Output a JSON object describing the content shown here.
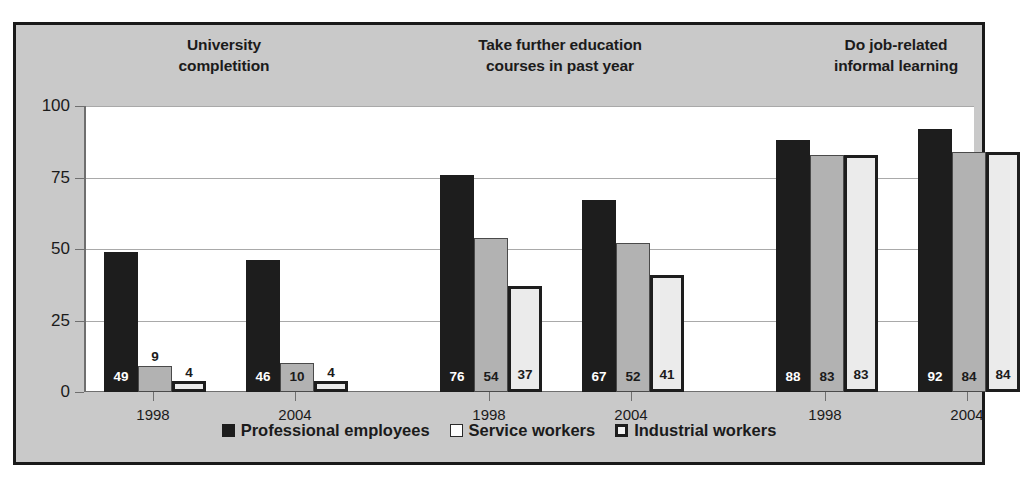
{
  "chart_data": {
    "type": "bar",
    "title": "",
    "xlabel": "",
    "ylabel": "",
    "ylim": [
      0,
      100
    ],
    "yticks": [
      "0",
      "25",
      "50",
      "75",
      "100"
    ],
    "grid": true,
    "legend_position": "bottom",
    "groups": [
      {
        "title_line1": "University",
        "title_line2": "completition",
        "clusters": [
          {
            "year": "1998",
            "values": [
              49,
              9,
              4
            ]
          },
          {
            "year": "2004",
            "values": [
              46,
              10,
              4
            ]
          }
        ]
      },
      {
        "title_line1": "Take further education",
        "title_line2": "courses in past year",
        "clusters": [
          {
            "year": "1998",
            "values": [
              76,
              54,
              37
            ]
          },
          {
            "year": "2004",
            "values": [
              67,
              52,
              41
            ]
          }
        ]
      },
      {
        "title_line1": "Do job-related",
        "title_line2": "informal learning",
        "clusters": [
          {
            "year": "1998",
            "values": [
              88,
              83,
              83
            ]
          },
          {
            "year": "2004",
            "values": [
              92,
              84,
              84
            ]
          }
        ]
      }
    ],
    "series": [
      {
        "name": "Professional employees",
        "color": "#1d1d1d",
        "values": [
          49,
          46,
          76,
          67,
          88,
          92
        ]
      },
      {
        "name": "Service workers",
        "color": "#b2b2b2",
        "values": [
          9,
          10,
          54,
          52,
          83,
          84
        ]
      },
      {
        "name": "Industrial workers",
        "color": "#ebebeb",
        "values": [
          4,
          4,
          37,
          41,
          83,
          84
        ]
      }
    ],
    "categories": [
      "1998",
      "2004",
      "1998",
      "2004",
      "1998",
      "2004"
    ]
  },
  "legend": {
    "items": [
      {
        "label": "Professional employees",
        "swatch": "filled-black-square-icon"
      },
      {
        "label": "Service workers",
        "swatch": "outlined-white-square-icon"
      },
      {
        "label": "Industrial workers",
        "swatch": "thick-outlined-square-icon"
      }
    ]
  },
  "colors": {
    "frame_border": "#1a1a1a",
    "band_background": "#c9c9c9",
    "plot_background": "#ffffff",
    "gridline": "#a9a9a9",
    "axis": "#6f6f6f",
    "series1": "#1d1d1d",
    "series2": "#b2b2b2",
    "series3": "#ebebeb",
    "text": "#1b1b1b"
  }
}
